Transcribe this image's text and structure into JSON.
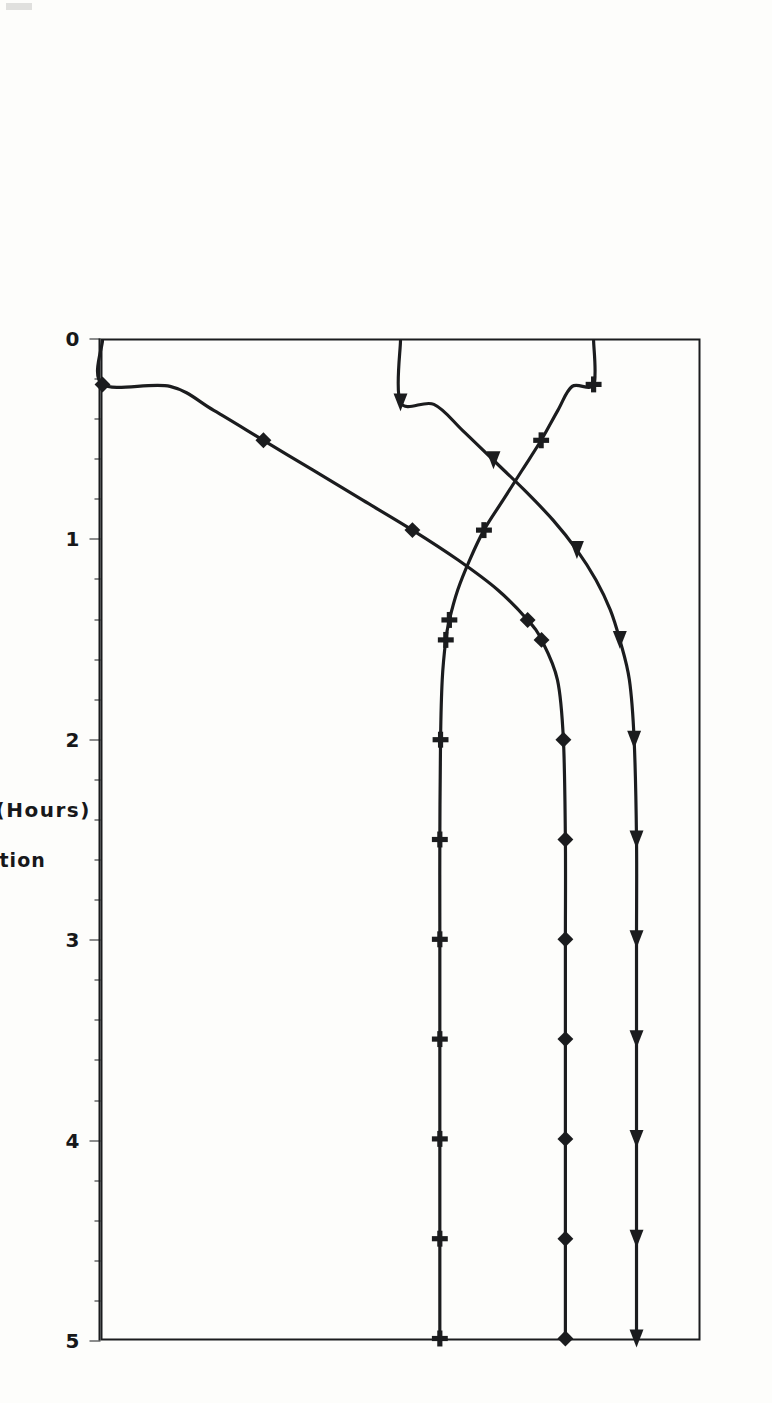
{
  "figure": {
    "orientation_note_hidden": "",
    "x_axis": {
      "title": "Time (Hours)",
      "min": 0,
      "max": 5,
      "major_ticks": [
        0,
        1,
        2,
        3,
        4,
        5
      ],
      "tick_labels": [
        "0",
        "1",
        "2",
        "3",
        "4",
        "5"
      ],
      "minor_per_major": 5
    },
    "value_axes": [
      {
        "id": "benzene",
        "series_label": "BENZENE Fraction",
        "marker_glyph": "+",
        "marker_name": "plus-marker",
        "exponent_text": "X10",
        "exponent_sup": "-3",
        "min": 935,
        "max": 960,
        "tick_labels": [
          "960",
          "955",
          "950",
          "945",
          "940",
          "935"
        ],
        "tick_values": [
          960,
          955,
          950,
          945,
          940,
          935
        ],
        "minor_per_major": 5
      },
      {
        "id": "toluene",
        "series_label": "TOLUENE Fraction",
        "marker_glyph": "▲",
        "marker_name": "triangle-marker",
        "exponent_text": "X10",
        "exponent_sup": "-2",
        "min": 85,
        "max": 90,
        "tick_labels": [
          "90",
          "89",
          "88",
          "87",
          "86",
          "85"
        ],
        "tick_values": [
          90,
          89,
          88,
          87,
          86,
          85
        ],
        "minor_per_major": 5
      },
      {
        "id": "oxylene",
        "series_label": "O-XYLENE Fraction",
        "marker_glyph": "◆",
        "marker_name": "diamond-marker",
        "exponent_text": "X10",
        "exponent_sup": "-2",
        "min": 90,
        "max": 96,
        "tick_labels": [
          "96",
          "95",
          "94",
          "93",
          "92",
          "91",
          "90"
        ],
        "tick_values": [
          96,
          95,
          94,
          93,
          92,
          91,
          90
        ],
        "minor_per_major": 5
      }
    ]
  },
  "chart_data": {
    "type": "line",
    "title": "",
    "xlabel": "Time (Hours)",
    "ylabel": "",
    "xlim": [
      0,
      5
    ],
    "grid": false,
    "legend_position": "below-axes",
    "note": "Three species share the time axis; each has its own stacked value scale. Values below are in each axis' own native units.",
    "series": [
      {
        "name": "O-XYLENE Fraction",
        "axis": "oxylene",
        "units": "x10^-2",
        "ylim": [
          90,
          96
        ],
        "marker": "diamond",
        "x": [
          0.0,
          0.22,
          0.23,
          0.35,
          0.5,
          0.65,
          0.8,
          0.95,
          1.1,
          1.25,
          1.4,
          1.5,
          1.7,
          2.0,
          2.5,
          3.0,
          3.5,
          4.0,
          4.5,
          5.0
        ],
        "y": [
          90.0,
          90.0,
          90.68,
          91.12,
          91.62,
          92.12,
          92.62,
          93.12,
          93.58,
          93.98,
          94.28,
          94.42,
          94.58,
          94.64,
          94.66,
          94.66,
          94.66,
          94.66,
          94.66,
          94.66
        ]
      },
      {
        "name": "TOLUENE Fraction",
        "axis": "toluene",
        "units": "x10^-2",
        "ylim": [
          85,
          90
        ],
        "marker": "triangle",
        "x": [
          0.0,
          0.31,
          0.32,
          0.45,
          0.6,
          0.75,
          0.9,
          1.05,
          1.2,
          1.35,
          1.5,
          1.7,
          2.0,
          2.5,
          3.0,
          3.5,
          4.0,
          4.5,
          5.0
        ],
        "y": [
          87.5,
          87.5,
          87.78,
          88.02,
          88.28,
          88.54,
          88.78,
          88.98,
          89.14,
          89.26,
          89.34,
          89.42,
          89.46,
          89.48,
          89.48,
          89.48,
          89.48,
          89.48,
          89.48
        ]
      },
      {
        "name": "BENZENE Fraction",
        "axis": "benzene",
        "units": "x10^-3",
        "ylim": [
          935,
          960
        ],
        "marker": "plus",
        "x": [
          0.0,
          0.22,
          0.23,
          0.35,
          0.5,
          0.65,
          0.8,
          0.95,
          1.1,
          1.25,
          1.4,
          1.5,
          1.7,
          2.0,
          2.5,
          3.0,
          3.5,
          4.0,
          4.5,
          5.0
        ],
        "y": [
          955.6,
          955.6,
          954.7,
          954.1,
          953.4,
          952.6,
          951.8,
          951.0,
          950.4,
          949.9,
          949.55,
          949.4,
          949.25,
          949.18,
          949.15,
          949.15,
          949.15,
          949.15,
          949.15,
          949.15
        ]
      }
    ]
  },
  "colors": {
    "ink": "#1b1c1e",
    "paper": "#fdfdfb"
  }
}
